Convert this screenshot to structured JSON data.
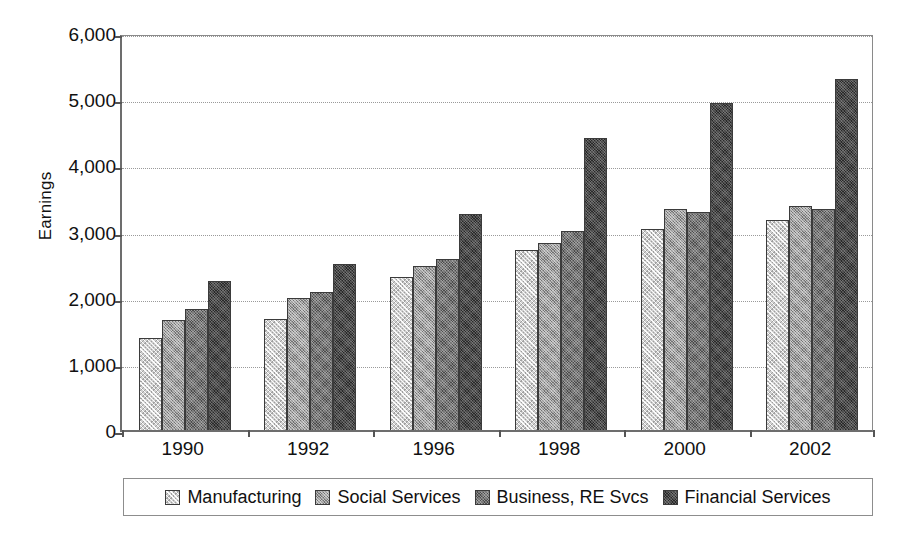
{
  "chart_data": {
    "type": "bar",
    "title": "",
    "xlabel": "",
    "ylabel": "Earnings",
    "ylim": [
      0,
      6000
    ],
    "ytick_values": [
      0,
      1000,
      2000,
      3000,
      4000,
      5000,
      6000
    ],
    "ytick_labels": [
      "0",
      "1,000",
      "2,000",
      "3,000",
      "4,000",
      "5,000",
      "6,000"
    ],
    "grid": true,
    "grid_axis": "y",
    "legend_position": "bottom",
    "categories": [
      "1990",
      "1992",
      "1996",
      "1998",
      "2000",
      "2002"
    ],
    "series": [
      {
        "name": "Manufacturing",
        "color": "#cfcfcf",
        "values": [
          1390,
          1680,
          2310,
          2720,
          3040,
          3170
        ]
      },
      {
        "name": "Social Services",
        "color": "#9b9b9b",
        "values": [
          1660,
          1990,
          2480,
          2820,
          3340,
          3380
        ]
      },
      {
        "name": "Business, RE Svcs",
        "color": "#757575",
        "values": [
          1830,
          2090,
          2580,
          3010,
          3300,
          3340
        ]
      },
      {
        "name": "Financial Services",
        "color": "#4a4a4a",
        "values": [
          2250,
          2510,
          3270,
          4410,
          4940,
          5300
        ]
      }
    ]
  },
  "axis": {
    "y_title": "Earnings"
  },
  "legend": {
    "entries": [
      {
        "label": "Manufacturing",
        "swatch": "legend-swatch-manufacturing"
      },
      {
        "label": "Social Services",
        "swatch": "legend-swatch-social-services"
      },
      {
        "label": "Business, RE Svcs",
        "swatch": "legend-swatch-business-re-svcs"
      },
      {
        "label": "Financial Services",
        "swatch": "legend-swatch-financial-services"
      }
    ]
  }
}
